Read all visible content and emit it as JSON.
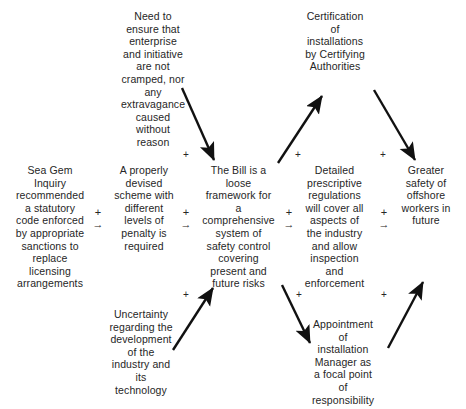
{
  "diagram": {
    "type": "causal-map",
    "title": "",
    "nodes": [
      {
        "id": "need-to-ensure",
        "text": "Need to\nensure that\nenterprise\nand initiative\nare not\ncramped, nor\nany\nextravagance\ncaused\nwithout\nreason"
      },
      {
        "id": "certification",
        "text": "Certification\nof\ninstallations\nby Certifying\nAuthorities"
      },
      {
        "id": "sea-gem-inquiry",
        "text": "Sea Gem\nInquiry\nrecommended\na statutory\ncode enforced\nby appropriate\nsanctions to\nreplace\nlicensing\narrangements"
      },
      {
        "id": "properly-devised-scheme",
        "text": "A properly\ndevised\nscheme with\ndifferent\nlevels of\npenalty is\nrequired"
      },
      {
        "id": "the-bill",
        "text": "The Bill is a\nloose\nframework for\na\ncomprehensive\nsystem of\nsafety control\ncovering\npresent and\nfuture risks"
      },
      {
        "id": "detailed-regulations",
        "text": "Detailed\nprescriptive\nregulations\nwill cover all\naspects of\nthe industry\nand allow\ninspection\nand\nenforcement"
      },
      {
        "id": "greater-safety",
        "text": "Greater\nsafety of\noffshore\nworkers in\nfuture"
      },
      {
        "id": "uncertainty",
        "text": "Uncertainty\nregarding the\ndevelopment\nof the\nindustry and\nits\ntechnology"
      },
      {
        "id": "appointment",
        "text": "Appointment\nof\ninstallation\nManager as\na focal point\nof\nresponsibility"
      }
    ],
    "connectors": [
      {
        "id": "c1",
        "plus": "+",
        "arrow": "→"
      },
      {
        "id": "c2",
        "plus": "+",
        "arrow": "→"
      },
      {
        "id": "c3",
        "plus": "+",
        "arrow": "→"
      },
      {
        "id": "c4",
        "plus": "+",
        "arrow": "→"
      }
    ],
    "plus_labels": [
      {
        "id": "p-top-1",
        "text": "+"
      },
      {
        "id": "p-top-2",
        "text": "+"
      },
      {
        "id": "p-top-3",
        "text": "+"
      },
      {
        "id": "p-bottom-1",
        "text": "+"
      },
      {
        "id": "p-bottom-2",
        "text": "+"
      },
      {
        "id": "p-bottom-3",
        "text": "+"
      }
    ],
    "colors": {
      "background": "#ffffff",
      "text": "#262626",
      "arrow": "#111111"
    }
  }
}
